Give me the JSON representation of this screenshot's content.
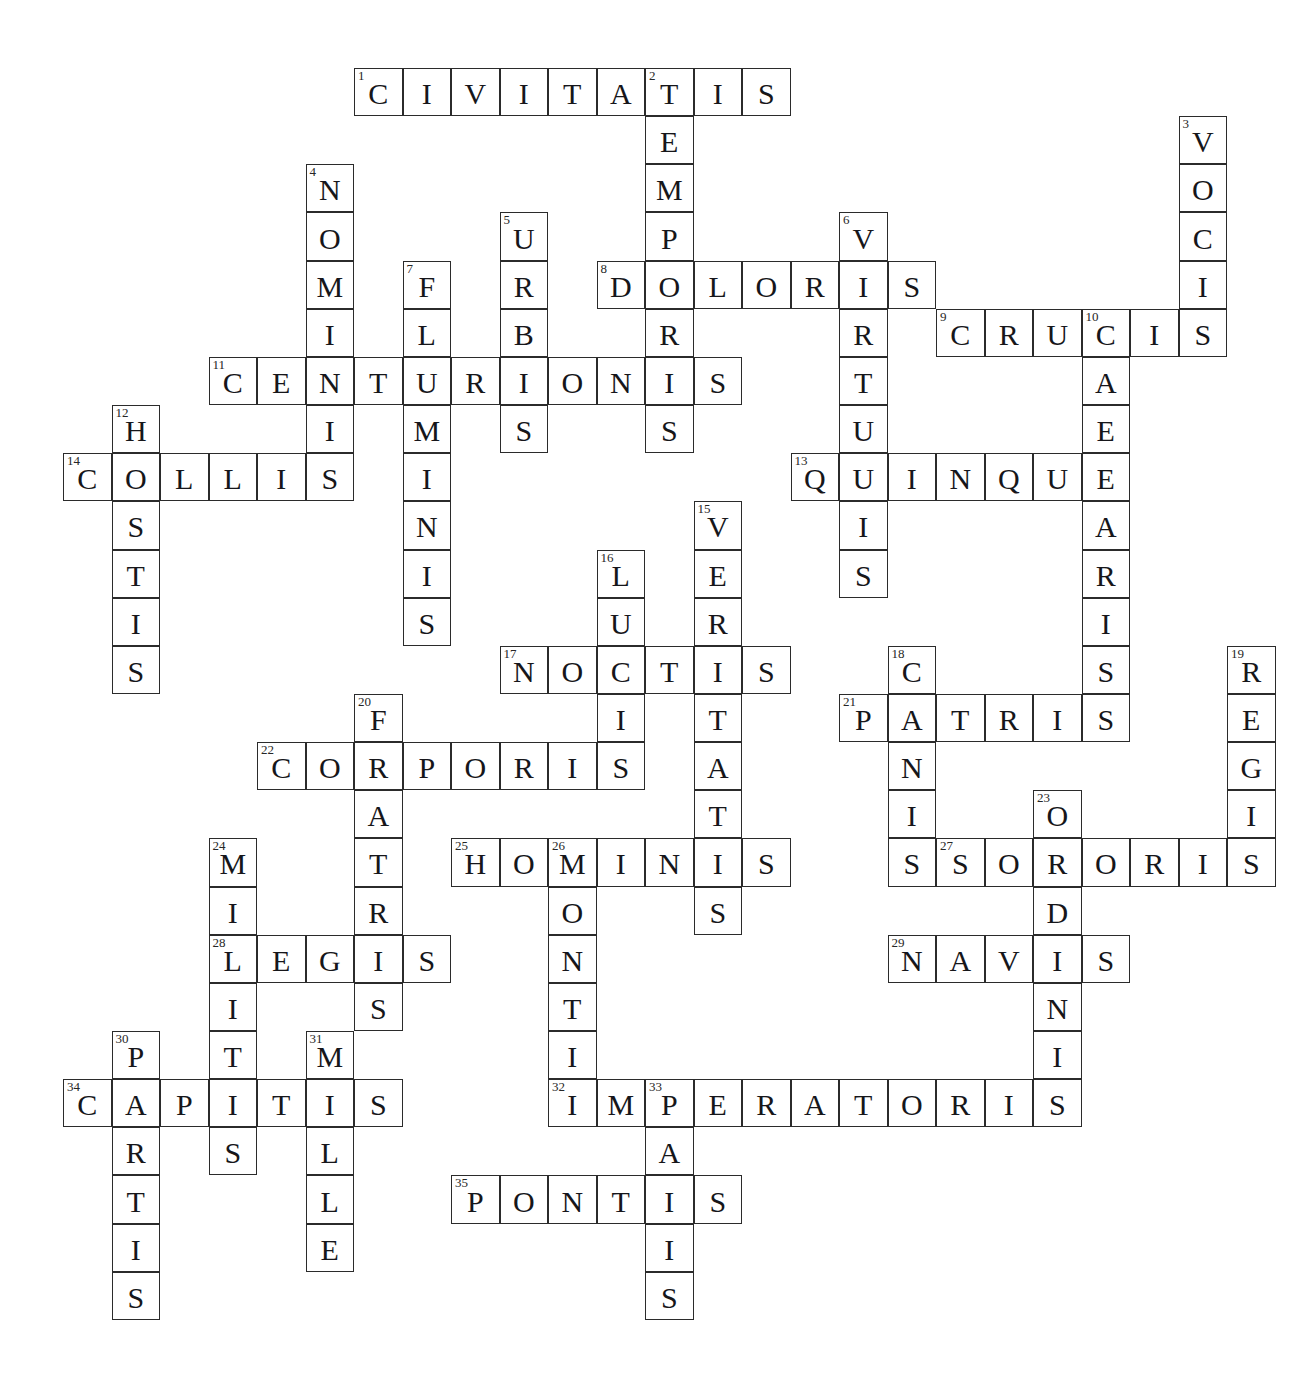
{
  "puzzle": {
    "title": "",
    "grid": {
      "cell_size": 48.5,
      "origin_x": 63,
      "origin_y": 68,
      "cols": 26,
      "rows": 27
    },
    "entries": [
      {
        "number": 1,
        "direction": "across",
        "answer": "CIVITATIS",
        "row": 0,
        "col": 6
      },
      {
        "number": 2,
        "direction": "down",
        "answer": "TEMPORIS",
        "row": 0,
        "col": 12
      },
      {
        "number": 3,
        "direction": "down",
        "answer": "VOCIS",
        "row": 1,
        "col": 23
      },
      {
        "number": 4,
        "direction": "down",
        "answer": "NOMINIS",
        "row": 2,
        "col": 5
      },
      {
        "number": 5,
        "direction": "down",
        "answer": "URBIS",
        "row": 3,
        "col": 9
      },
      {
        "number": 6,
        "direction": "down",
        "answer": "VIRTUTIS",
        "row": 3,
        "col": 16
      },
      {
        "number": 7,
        "direction": "down",
        "answer": "FLUMINIS",
        "row": 4,
        "col": 7
      },
      {
        "number": 8,
        "direction": "across",
        "answer": "DOLORIS",
        "row": 4,
        "col": 11
      },
      {
        "number": 9,
        "direction": "across",
        "answer": "CRUCIS",
        "row": 5,
        "col": 18
      },
      {
        "number": 10,
        "direction": "down",
        "answer": "CAESARIS",
        "row": 5,
        "col": 21
      },
      {
        "number": 11,
        "direction": "across",
        "answer": "CENTURIONIS",
        "row": 6,
        "col": 3
      },
      {
        "number": 12,
        "direction": "down",
        "answer": "HOSTIS",
        "row": 7,
        "col": 1
      },
      {
        "number": 13,
        "direction": "across",
        "answer": "QUINQUE",
        "row": 8,
        "col": 15
      },
      {
        "number": 14,
        "direction": "across",
        "answer": "COLLIS",
        "row": 8,
        "col": 0
      },
      {
        "number": 15,
        "direction": "down",
        "answer": "VERITATIS",
        "row": 9,
        "col": 13
      },
      {
        "number": 16,
        "direction": "down",
        "answer": "LUCIS",
        "row": 10,
        "col": 11
      },
      {
        "number": 17,
        "direction": "across",
        "answer": "NOCTIS",
        "row": 12,
        "col": 9
      },
      {
        "number": 18,
        "direction": "down",
        "answer": "CANIS",
        "row": 12,
        "col": 17
      },
      {
        "number": 19,
        "direction": "down",
        "answer": "REGIS",
        "row": 12,
        "col": 24
      },
      {
        "number": 20,
        "direction": "down",
        "answer": "FRATRIS",
        "row": 13,
        "col": 6
      },
      {
        "number": 21,
        "direction": "across",
        "answer": "PATRIS",
        "row": 13,
        "col": 16
      },
      {
        "number": 22,
        "direction": "across",
        "answer": "CORPORIS",
        "row": 14,
        "col": 4
      },
      {
        "number": 23,
        "direction": "down",
        "answer": "ORDINIS",
        "row": 15,
        "col": 20
      },
      {
        "number": 24,
        "direction": "down",
        "answer": "MILITIS",
        "row": 16,
        "col": 3
      },
      {
        "number": 25,
        "direction": "across",
        "answer": "HOMINIS",
        "row": 16,
        "col": 8
      },
      {
        "number": 26,
        "direction": "down",
        "answer": "MONTIS",
        "row": 16,
        "col": 10
      },
      {
        "number": 27,
        "direction": "across",
        "answer": "SORORIS",
        "row": 16,
        "col": 18
      },
      {
        "number": 28,
        "direction": "across",
        "answer": "LEGIS",
        "row": 18,
        "col": 3
      },
      {
        "number": 29,
        "direction": "across",
        "answer": "NAVIS",
        "row": 18,
        "col": 17
      },
      {
        "number": 30,
        "direction": "down",
        "answer": "PARTIS",
        "row": 20,
        "col": 1
      },
      {
        "number": 31,
        "direction": "down",
        "answer": "MILLE",
        "row": 20,
        "col": 5
      },
      {
        "number": 32,
        "direction": "across",
        "answer": "IMPERATORIS",
        "row": 21,
        "col": 10
      },
      {
        "number": 33,
        "direction": "down",
        "answer": "PACIS",
        "row": 21,
        "col": 12
      },
      {
        "number": 34,
        "direction": "across",
        "answer": "CAPITIS",
        "row": 21,
        "col": 0
      },
      {
        "number": 35,
        "direction": "across",
        "answer": "PONTIS",
        "row": 23,
        "col": 8
      }
    ]
  },
  "colors": {
    "cell_border": "#2b2b2b",
    "cell_background": "#ffffff",
    "letter": "#16161a",
    "number": "#262626",
    "page_background": "#ffffff"
  }
}
